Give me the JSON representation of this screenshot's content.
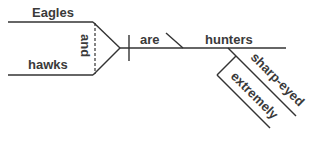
{
  "diagram": {
    "type": "sentence-diagram",
    "subjects": [
      "Eagles",
      "hawks"
    ],
    "conjunction": "and",
    "verb": "are",
    "predicate_noun": "hunters",
    "modifier": "sharp-eyed",
    "modifier_of_modifier": "extremely",
    "colors": {
      "line": "#333333",
      "text": "#3a3a3a"
    }
  }
}
